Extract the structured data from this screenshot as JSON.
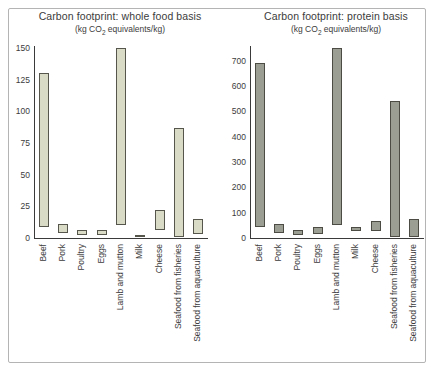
{
  "figure": {
    "kind": "double-bar-range-figure",
    "background": "#ffffff",
    "border_color": "#b4b4b4",
    "axis_color": "#3a3a3a",
    "text_color": "#3c3c3c"
  },
  "chart_data": [
    {
      "type": "bar",
      "subtype": "floating-range-bars",
      "title": "Carbon footprint: whole food basis",
      "subtitle": {
        "prefix": "(kg CO",
        "sub": "2",
        "suffix": " equivalents/kg)"
      },
      "unit": "kg CO2 equivalents/kg",
      "xlabel": "",
      "ylabel": "",
      "ylim": [
        0,
        150
      ],
      "yticks": [
        0,
        25,
        50,
        75,
        100,
        125,
        150
      ],
      "grid": false,
      "legend": null,
      "categories": [
        "Beef",
        "Pork",
        "Poultry",
        "Eggs",
        "Lamb and mutton",
        "Milk",
        "Cheese",
        "Seafood from fisheries",
        "Seafood from aquaculture"
      ],
      "series": [
        {
          "name": "carbon-footprint-range-min-max",
          "values_min": [
            9,
            4,
            2,
            2,
            10,
            1,
            6,
            1,
            3
          ],
          "values_max": [
            130,
            11,
            6,
            6,
            150,
            2,
            22,
            87,
            15
          ]
        }
      ],
      "bar_fill": "#d9dbc6",
      "bar_border": "#56564c"
    },
    {
      "type": "bar",
      "subtype": "floating-range-bars",
      "title": "Carbon footprint: protein basis",
      "subtitle": {
        "prefix": "(kg CO",
        "sub": "2",
        "suffix": " equivalents/kg)"
      },
      "unit": "kg CO2 equivalents/kg",
      "xlabel": "",
      "ylabel": "",
      "ylim": [
        0,
        750
      ],
      "yticks": [
        0,
        100,
        200,
        300,
        400,
        500,
        600,
        700
      ],
      "grid": false,
      "legend": null,
      "categories": [
        "Beef",
        "Pork",
        "Poultry",
        "Eggs",
        "Lamb and mutton",
        "Milk",
        "Cheese",
        "Seafood from fisheries",
        "Seafood from aquaculture"
      ],
      "series": [
        {
          "name": "carbon-footprint-range-min-max",
          "values_min": [
            45,
            20,
            10,
            15,
            50,
            28,
            28,
            5,
            5
          ],
          "values_max": [
            690,
            55,
            30,
            42,
            750,
            43,
            68,
            540,
            75
          ]
        }
      ],
      "bar_fill": "#9b9e93",
      "bar_border": "#4c4c45"
    }
  ]
}
